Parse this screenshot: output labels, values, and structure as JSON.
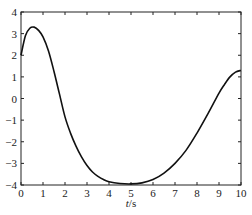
{
  "chart_data": {
    "type": "line",
    "title": "",
    "xlabel": "t/s",
    "xlabel_italic_part": "t",
    "xlabel_unit_part": "/s",
    "ylabel": "",
    "xlim": [
      0,
      10
    ],
    "ylim": [
      -4,
      4
    ],
    "xticks": [
      0,
      1,
      2,
      3,
      4,
      5,
      6,
      7,
      8,
      9,
      10
    ],
    "yticks": [
      -4,
      -3,
      -2,
      -1,
      0,
      1,
      2,
      3,
      4
    ],
    "grid": false,
    "legend": null,
    "series": [
      {
        "name": "",
        "color": "#111111",
        "x": [
          0,
          0.2,
          0.4,
          0.6,
          0.8,
          1.0,
          1.25,
          1.5,
          1.75,
          2.0,
          2.25,
          2.5,
          2.75,
          3.0,
          3.25,
          3.5,
          3.75,
          4.0,
          4.5,
          5.0,
          5.5,
          6.0,
          6.5,
          7.0,
          7.5,
          8.0,
          8.5,
          9.0,
          9.25,
          9.5,
          9.75,
          10.0
        ],
        "y": [
          2.0,
          2.9,
          3.25,
          3.3,
          3.15,
          2.85,
          2.2,
          1.25,
          0.2,
          -0.85,
          -1.6,
          -2.2,
          -2.7,
          -3.1,
          -3.4,
          -3.6,
          -3.75,
          -3.85,
          -3.93,
          -3.95,
          -3.9,
          -3.75,
          -3.45,
          -3.0,
          -2.4,
          -1.6,
          -0.7,
          0.25,
          0.65,
          1.0,
          1.22,
          1.3
        ]
      }
    ]
  }
}
